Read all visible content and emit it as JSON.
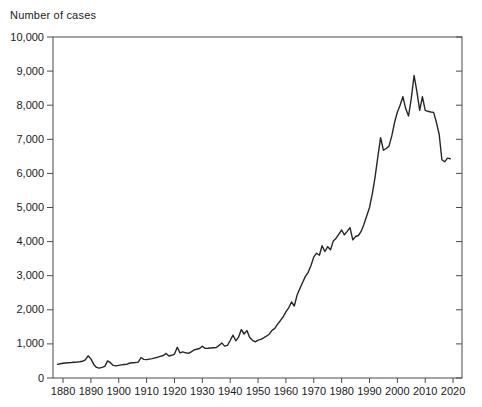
{
  "window": {
    "background_color": "#ffffff",
    "text_color": "#1a1a1a"
  },
  "chart_data": {
    "type": "line",
    "title": "Number of cases",
    "ylabel": "Number of cases",
    "xlabel": "",
    "grid": false,
    "legend": "none",
    "boxed_frame": true,
    "line_color": "#262626",
    "axis_color": "#4a4a4a",
    "xlim": [
      1876.4,
      2023.2
    ],
    "ylim": [
      0,
      10000
    ],
    "x_ticks": [
      1880,
      1890,
      1900,
      1910,
      1920,
      1930,
      1940,
      1950,
      1960,
      1970,
      1980,
      1990,
      2000,
      2010,
      2020
    ],
    "x_tick_labels": [
      "1880",
      "1890",
      "1900",
      "1910",
      "1920",
      "1930",
      "1940",
      "1950",
      "1960",
      "1970",
      "1980",
      "1990",
      "2000",
      "2010",
      "2020"
    ],
    "y_ticks": [
      0,
      1000,
      2000,
      3000,
      4000,
      5000,
      6000,
      7000,
      8000,
      9000,
      10000
    ],
    "y_tick_labels": [
      "0",
      "1,000",
      "2,000",
      "3,000",
      "4,000",
      "5,000",
      "6,000",
      "7,000",
      "8,000",
      "9,000",
      "10,000"
    ],
    "x": [
      1878,
      1879,
      1880,
      1881,
      1882,
      1883,
      1884,
      1885,
      1886,
      1887,
      1888,
      1889,
      1890,
      1891,
      1892,
      1893,
      1894,
      1895,
      1896,
      1897,
      1898,
      1899,
      1900,
      1901,
      1902,
      1903,
      1904,
      1905,
      1906,
      1907,
      1908,
      1909,
      1910,
      1911,
      1912,
      1913,
      1914,
      1915,
      1916,
      1917,
      1918,
      1919,
      1920,
      1921,
      1922,
      1923,
      1924,
      1925,
      1926,
      1927,
      1928,
      1929,
      1930,
      1931,
      1932,
      1933,
      1934,
      1935,
      1936,
      1937,
      1938,
      1939,
      1940,
      1941,
      1942,
      1943,
      1944,
      1945,
      1946,
      1947,
      1948,
      1949,
      1950,
      1951,
      1952,
      1953,
      1954,
      1955,
      1956,
      1957,
      1958,
      1959,
      1960,
      1961,
      1962,
      1963,
      1964,
      1965,
      1966,
      1967,
      1968,
      1969,
      1970,
      1971,
      1972,
      1973,
      1974,
      1975,
      1976,
      1977,
      1978,
      1979,
      1980,
      1981,
      1982,
      1983,
      1984,
      1985,
      1986,
      1987,
      1988,
      1989,
      1990,
      1991,
      1992,
      1993,
      1994,
      1995,
      1996,
      1997,
      1998,
      1999,
      2000,
      2001,
      2002,
      2003,
      2004,
      2005,
      2006,
      2007,
      2008,
      2009,
      2010,
      2011,
      2012,
      2013,
      2014,
      2015,
      2016,
      2017,
      2018,
      2019
    ],
    "values": [
      400,
      415,
      430,
      440,
      448,
      455,
      462,
      468,
      478,
      490,
      530,
      650,
      560,
      400,
      310,
      290,
      315,
      340,
      500,
      450,
      370,
      355,
      370,
      385,
      395,
      405,
      440,
      450,
      455,
      465,
      600,
      545,
      540,
      555,
      570,
      590,
      610,
      635,
      660,
      720,
      645,
      665,
      700,
      900,
      735,
      765,
      740,
      720,
      765,
      820,
      845,
      865,
      930,
      868,
      872,
      880,
      888,
      895,
      955,
      1030,
      935,
      955,
      1100,
      1255,
      1090,
      1200,
      1420,
      1290,
      1390,
      1190,
      1105,
      1060,
      1110,
      1135,
      1180,
      1225,
      1285,
      1400,
      1455,
      1580,
      1680,
      1790,
      1940,
      2060,
      2230,
      2110,
      2430,
      2620,
      2800,
      2980,
      3100,
      3300,
      3550,
      3660,
      3600,
      3880,
      3710,
      3850,
      3760,
      4020,
      4100,
      4220,
      4340,
      4200,
      4300,
      4410,
      4050,
      4150,
      4180,
      4300,
      4500,
      4750,
      5000,
      5400,
      5900,
      6500,
      7050,
      6680,
      6730,
      6800,
      7100,
      7500,
      7800,
      8000,
      8250,
      7900,
      7680,
      8200,
      8870,
      8400,
      7850,
      8250,
      7850,
      7820,
      7800,
      7790,
      7500,
      7140,
      6400,
      6340,
      6450,
      6430
    ]
  }
}
